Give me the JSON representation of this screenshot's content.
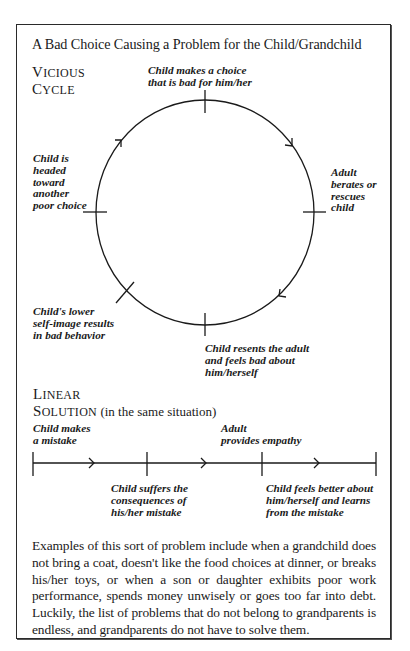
{
  "title": "A Bad Choice Causing a Problem for the Child/Grandchild",
  "vicious_cycle": {
    "heading_line1": "Vicious",
    "heading_line2": "Cycle",
    "nodes": [
      {
        "id": "top",
        "label": "Child makes a choice\nthat is bad for him/her"
      },
      {
        "id": "right",
        "label": "Adult\nberates or\nrescues\nchild"
      },
      {
        "id": "bottom",
        "label": "Child resents the adult\nand feels bad about\nhim/herself"
      },
      {
        "id": "lower-left",
        "label": "Child's lower\nself-image results\nin bad behavior"
      },
      {
        "id": "left",
        "label": "Child is\nheaded\ntoward\nanother\npoor choice"
      }
    ],
    "direction": "clockwise"
  },
  "linear_solution": {
    "heading_line1": "Linear",
    "heading_line2": "Solution",
    "heading_note": "(in the same situation)",
    "steps": [
      {
        "label": "Child makes\na mistake",
        "position": "above"
      },
      {
        "label": "Child suffers the\nconsequences of\nhis/her mistake",
        "position": "below"
      },
      {
        "label": "Adult\nprovides empathy",
        "position": "above"
      },
      {
        "label": "Child feels better about\nhim/herself and learns\nfrom the mistake",
        "position": "below"
      }
    ]
  },
  "paragraph": "Examples of this sort of problem include when a grandchild does not bring a coat, doesn't like the food choices at dinner, or breaks his/her toys, or when a son or daughter exhibits poor work performance, spends money unwisely or goes too far into debt. Luckily, the list of problems that do not belong to grandparents is endless, and grandparents do not have to solve them.",
  "colors": {
    "ink": "#1a1a1a",
    "background": "#ffffff",
    "frame": "#2a2a2a"
  }
}
